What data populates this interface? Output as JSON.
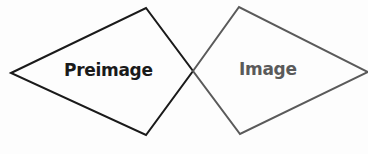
{
  "diagram": {
    "preimage": {
      "label": "Preimage",
      "color": "#1a1a1a",
      "points": "11,73 146,8 193,71 146,135"
    },
    "image": {
      "label": "Image",
      "color": "#5a5a5a",
      "points": "193,71 239,7 368,72 240,134"
    }
  }
}
